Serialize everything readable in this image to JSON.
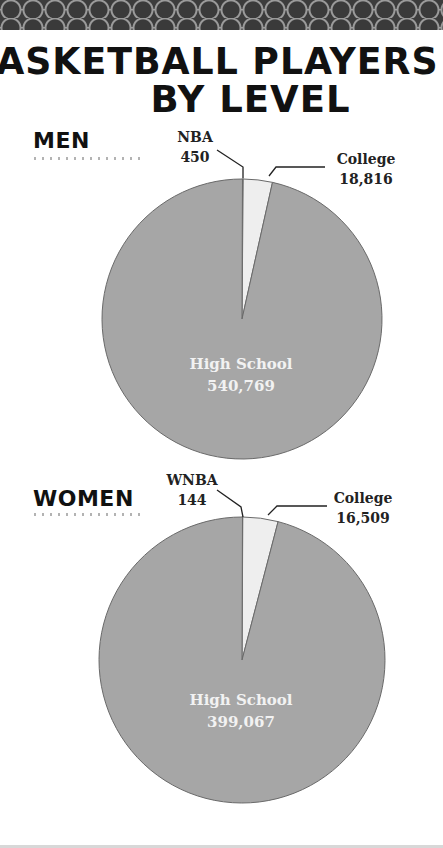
{
  "title": {
    "line1": "BASKETBALL PLAYERS",
    "line2": "BY LEVEL"
  },
  "colors": {
    "high_school": "#a6a6a6",
    "college": "#eeeeee",
    "pro": "#7a7a7a",
    "edge": "#6a6a6a",
    "texture": "#4a4a4a"
  },
  "sections": [
    {
      "heading": "MEN",
      "labels": {
        "pro_name": "NBA",
        "pro_value": "450",
        "college_name": "College",
        "college_value": "18,816",
        "hs_name": "High School",
        "hs_value": "540,769"
      }
    },
    {
      "heading": "WOMEN",
      "labels": {
        "pro_name": "WNBA",
        "pro_value": "144",
        "college_name": "College",
        "college_value": "16,509",
        "hs_name": "High School",
        "hs_value": "399,067"
      }
    }
  ],
  "chart_data": [
    {
      "type": "pie",
      "title": "BASKETBALL PLAYERS BY LEVEL — MEN",
      "categories": [
        "NBA",
        "College",
        "High School"
      ],
      "values": [
        450,
        18816,
        540769
      ],
      "legend": "none (direct labels)"
    },
    {
      "type": "pie",
      "title": "BASKETBALL PLAYERS BY LEVEL — WOMEN",
      "categories": [
        "WNBA",
        "College",
        "High School"
      ],
      "values": [
        144,
        16509,
        399067
      ],
      "legend": "none (direct labels)"
    }
  ]
}
